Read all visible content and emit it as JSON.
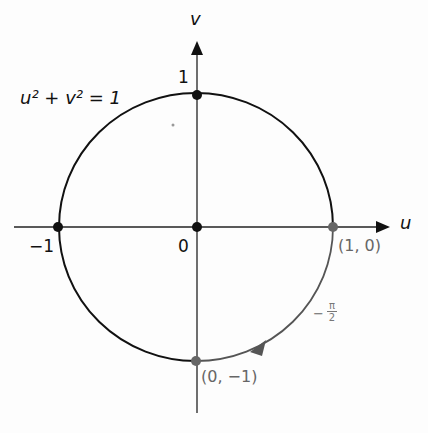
{
  "figure": {
    "equation_label": "u² + v² = 1",
    "axes": {
      "horizontal_label": "u",
      "vertical_label": "v"
    },
    "tick_labels": {
      "top": "1",
      "left": "−1",
      "origin": "0"
    },
    "points": {
      "right": "(1, 0)",
      "bottom": "(0, −1)"
    },
    "arc_label": {
      "sign": "−",
      "numerator": "π",
      "denominator": "2"
    },
    "colors": {
      "curve": "#111111",
      "highlight_arc": "#555555",
      "highlight_points": "#666666"
    }
  }
}
